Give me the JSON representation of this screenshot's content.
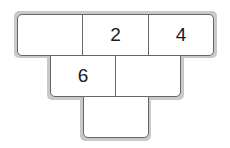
{
  "diagram": {
    "type": "number-pyramid",
    "rows": [
      {
        "row": "top",
        "cells": [
          "",
          "2",
          "4"
        ]
      },
      {
        "row": "middle",
        "cells": [
          "6",
          ""
        ]
      },
      {
        "row": "bottom",
        "cells": [
          ""
        ]
      }
    ]
  }
}
